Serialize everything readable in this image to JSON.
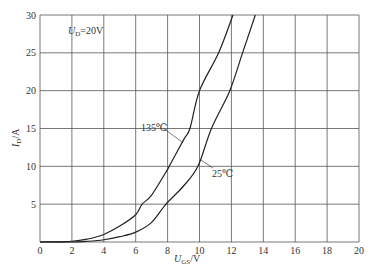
{
  "chart_data": {
    "type": "line",
    "title": "",
    "annotation": {
      "main": "U",
      "sub": "D",
      "rest": "=20V"
    },
    "xlabel": {
      "main": "U",
      "sub": "GS",
      "rest": "/V"
    },
    "ylabel": {
      "main": "I",
      "sub": "D",
      "rest": "/A"
    },
    "xlim": [
      0,
      20
    ],
    "ylim": [
      0,
      30
    ],
    "xticks": [
      0,
      2,
      4,
      6,
      8,
      10,
      12,
      14,
      16,
      18,
      20
    ],
    "yticks": [
      5,
      10,
      15,
      20,
      25,
      30
    ],
    "grid": true,
    "legend": "inline labels with leader lines",
    "series": [
      {
        "name": "135℃",
        "label": "135℃",
        "x": [
          0,
          2,
          3,
          4,
          5,
          6,
          6.4,
          7,
          8,
          8.1,
          9,
          9.4,
          10,
          11.2,
          12.1
        ],
        "y": [
          0,
          0.1,
          0.4,
          1.0,
          2.1,
          3.6,
          5,
          6.2,
          9.6,
          10,
          13.5,
          15,
          20,
          25,
          30
        ]
      },
      {
        "name": "25℃",
        "label": "25℃",
        "x": [
          0,
          2,
          3,
          4,
          5,
          6,
          7,
          7.9,
          9,
          9.9,
          10.75,
          11.9,
          12.7,
          13.5
        ],
        "y": [
          0,
          0,
          0.1,
          0.3,
          0.7,
          1.3,
          2.6,
          5,
          7.4,
          10,
          15,
          20,
          25,
          30
        ]
      }
    ]
  }
}
